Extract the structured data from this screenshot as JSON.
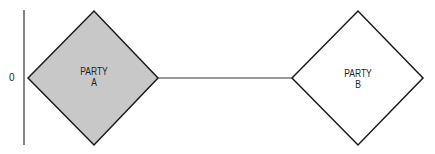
{
  "axis": {
    "label": "0"
  },
  "nodes": [
    {
      "id": "A",
      "line1": "PARTY",
      "line2": "A",
      "fill": "#c8c8c8"
    },
    {
      "id": "B",
      "line1": "PARTY",
      "line2": "B",
      "fill": "#ffffff"
    }
  ],
  "connector": {
    "from": "A",
    "to": "B"
  },
  "colors": {
    "stroke": "#1a1a1a",
    "shaded_fill": "#c8c8c8"
  }
}
